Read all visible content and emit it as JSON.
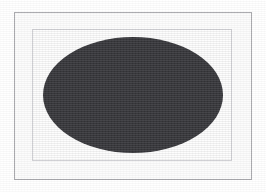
{
  "figure": {
    "kind": "ellipse-figure",
    "canvas_width": 266,
    "canvas_height": 192,
    "page_background_color": "#ffffff",
    "outer_frame": {
      "name": "outer-border-rectangle",
      "line_color": "#a9a9ad",
      "fill_color": "#fbfbfb",
      "x": 14,
      "y": 12,
      "width": 238,
      "height": 168,
      "line_width": 1
    },
    "inner_frame": {
      "name": "inner-border-rectangle",
      "line_color": "#cfcfd3",
      "fill_color": "#fdfdfd",
      "x": 32,
      "y": 29,
      "width": 200,
      "height": 132,
      "line_width": 1
    },
    "ellipse": {
      "name": "filled-ellipse",
      "fill_color": "#36363a",
      "stroke_color": "none",
      "center_x": 133,
      "center_y": 95,
      "radius_x": 90,
      "radius_y": 58,
      "bounds": {
        "left": 43,
        "top": 37,
        "right": 223,
        "bottom": 153
      }
    },
    "texture": {
      "name": "scan-grain",
      "opacity": 0.055
    }
  }
}
